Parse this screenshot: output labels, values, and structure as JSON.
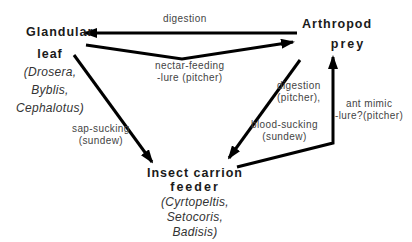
{
  "nodes": {
    "glandular_leaf": {
      "title_line1": "Glandular",
      "title_line2": "leaf",
      "taxa": [
        "(Drosera,",
        "Byblis,",
        "Cephalotus)"
      ]
    },
    "arthropod_prey": {
      "title_line1": "Arthropod",
      "title_line2": "prey"
    },
    "insect_carrion_feeder": {
      "title_line1": "Insect carrion",
      "title_line2": "feeder",
      "taxa": [
        "(Cyrtopeltis,",
        "Setocoris,",
        "Badisis)"
      ]
    }
  },
  "edges": {
    "prey_to_leaf": {
      "label": "digestion"
    },
    "leaf_to_prey": {
      "label_line1": "nectar-feeding",
      "label_line2": "-lure  (pitcher)"
    },
    "leaf_to_feeder": {
      "label_line1": "sap-sucking",
      "label_line2": "(sundew)"
    },
    "prey_to_feeder": {
      "label_line1": "digestion",
      "label_line2": "(pitcher),",
      "label_line3": "blood-sucking",
      "label_line4": "(sundew)"
    },
    "feeder_to_prey": {
      "label_line1": "ant  mimic",
      "label_line2": "-lure?(pitcher)"
    }
  }
}
